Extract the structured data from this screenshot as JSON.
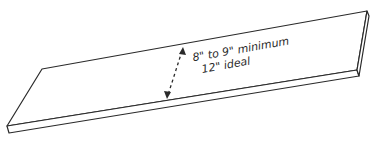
{
  "diagram": {
    "annotation": {
      "line1": "8\" to 9\" minimum",
      "line2": "12\" ideal"
    },
    "dimension": "board width"
  }
}
